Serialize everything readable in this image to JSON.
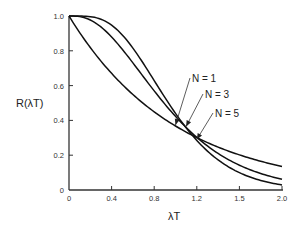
{
  "chart_data": {
    "type": "line",
    "title": "",
    "xlabel": "λT",
    "ylabel": "R(λT)",
    "xlim": [
      0,
      2.0
    ],
    "ylim": [
      0,
      1.0
    ],
    "grid": false,
    "legend": "inline annotations with arrows",
    "x_ticks": [
      {
        "value": 0,
        "label": "0"
      },
      {
        "value": 0.4,
        "label": "0.4"
      },
      {
        "value": 0.8,
        "label": "0.8"
      },
      {
        "value": 1.2,
        "label": "1.2"
      },
      {
        "value": 1.6,
        "label": "1.5"
      },
      {
        "value": 2.0,
        "label": "2.0"
      }
    ],
    "y_ticks": [
      {
        "value": 0,
        "label": "0"
      },
      {
        "value": 0.2,
        "label": "0.2"
      },
      {
        "value": 0.4,
        "label": "0.4"
      },
      {
        "value": 0.6,
        "label": "0.6"
      },
      {
        "value": 0.8,
        "label": "0.8"
      },
      {
        "value": 1.0,
        "label": "1.0"
      }
    ],
    "x": [
      0,
      0.2,
      0.4,
      0.6,
      0.7,
      0.8,
      1.0,
      1.2,
      1.4,
      1.6,
      1.8,
      2.0
    ],
    "series": [
      {
        "name": "N = 1",
        "values": [
          1.0,
          0.82,
          0.67,
          0.55,
          0.5,
          0.45,
          0.37,
          0.3,
          0.25,
          0.2,
          0.17,
          0.14
        ]
      },
      {
        "name": "N = 3",
        "values": [
          1.0,
          0.88,
          0.66,
          0.46,
          0.38,
          0.31,
          0.21,
          0.15,
          0.11,
          0.09,
          0.07,
          0.06
        ]
      },
      {
        "name": "N = 5",
        "values": [
          1.0,
          0.92,
          0.68,
          0.44,
          0.35,
          0.27,
          0.16,
          0.09,
          0.06,
          0.04,
          0.03,
          0.03
        ]
      }
    ],
    "annotations": [
      {
        "text": "N = 1",
        "points_to_x": 1.0
      },
      {
        "text": "N = 3",
        "points_to_x": 1.1
      },
      {
        "text": "N = 5",
        "points_to_x": 1.2
      }
    ]
  }
}
